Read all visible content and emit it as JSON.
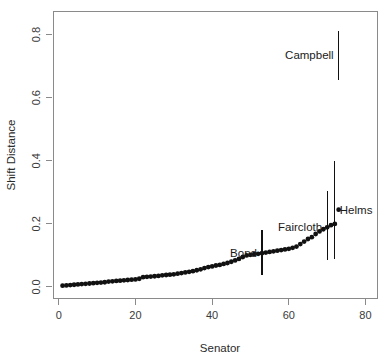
{
  "chart_data": {
    "type": "scatter",
    "title": "",
    "xlabel": "Senator",
    "ylabel": "Shift Distance",
    "xlim": [
      -1.5,
      83.0
    ],
    "ylim": [
      -0.035,
      0.875
    ],
    "grid": false,
    "legend": null,
    "xticks": [
      0,
      20,
      40,
      60,
      80
    ],
    "xtick_labels": [
      "0",
      "20",
      "40",
      "60",
      "80"
    ],
    "yticks": [
      0.0,
      0.2,
      0.4,
      0.6,
      0.8
    ],
    "ytick_labels": [
      "0.0",
      "0.2",
      "0.4",
      "0.6",
      "0.8"
    ],
    "series": [
      {
        "name": "Shift Distance by Senator",
        "marker": "filled-circle",
        "color": "#111111",
        "x": [
          1,
          2,
          3,
          4,
          5,
          6,
          7,
          8,
          9,
          10,
          11,
          12,
          13,
          14,
          15,
          16,
          17,
          18,
          19,
          20,
          21,
          22,
          23,
          24,
          25,
          26,
          27,
          28,
          29,
          30,
          31,
          32,
          33,
          34,
          35,
          36,
          37,
          38,
          39,
          40,
          41,
          42,
          43,
          44,
          45,
          46,
          47,
          48,
          49,
          50,
          51,
          52,
          53,
          54,
          55,
          56,
          57,
          58,
          59,
          60,
          61,
          62,
          63,
          64,
          65,
          66,
          67,
          68,
          69,
          70,
          71,
          72,
          73
        ],
        "values": [
          0.004,
          0.005,
          0.006,
          0.007,
          0.008,
          0.009,
          0.01,
          0.011,
          0.012,
          0.013,
          0.014,
          0.015,
          0.017,
          0.018,
          0.019,
          0.02,
          0.021,
          0.022,
          0.023,
          0.024,
          0.026,
          0.031,
          0.032,
          0.033,
          0.034,
          0.035,
          0.037,
          0.038,
          0.039,
          0.04,
          0.042,
          0.044,
          0.046,
          0.048,
          0.05,
          0.053,
          0.056,
          0.06,
          0.063,
          0.065,
          0.068,
          0.07,
          0.073,
          0.076,
          0.08,
          0.084,
          0.089,
          0.095,
          0.1,
          0.102,
          0.104,
          0.105,
          0.107,
          0.109,
          0.111,
          0.113,
          0.115,
          0.117,
          0.119,
          0.121,
          0.124,
          0.128,
          0.136,
          0.144,
          0.152,
          0.158,
          0.168,
          0.176,
          0.183,
          0.189,
          0.196,
          0.2,
          0.245
        ]
      }
    ],
    "error_bars": [
      {
        "label": "Bond",
        "x": 53,
        "value": 0.107,
        "low": 0.037,
        "high": 0.18,
        "label_side": "left"
      },
      {
        "label": "Faircloth",
        "x": 70,
        "value": 0.189,
        "low": 0.085,
        "high": 0.305,
        "label_side": "left"
      },
      {
        "label": "Helms",
        "x": 72,
        "value": 0.245,
        "low": 0.09,
        "high": 0.4,
        "label_side": "right"
      },
      {
        "label": "Campbell",
        "x": 73,
        "value": 0.735,
        "low": 0.655,
        "high": 0.812,
        "label_side": "left"
      }
    ],
    "annotations": [
      {
        "text": "Bond",
        "x": 53,
        "y": 0.107
      },
      {
        "text": "Faircloth",
        "x": 70,
        "y": 0.189
      },
      {
        "text": "Helms",
        "x": 72,
        "y": 0.245
      },
      {
        "text": "Campbell",
        "x": 73,
        "y": 0.735
      }
    ]
  }
}
